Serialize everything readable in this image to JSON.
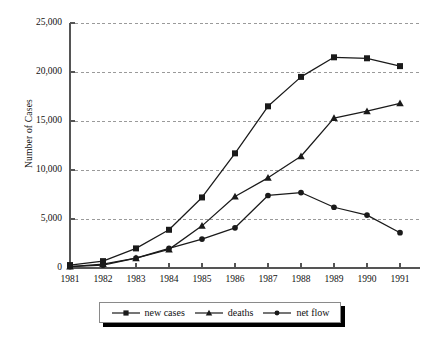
{
  "chart_data": {
    "type": "line",
    "title": "",
    "xlabel": "",
    "ylabel": "Number of Cases",
    "x": [
      1981,
      1982,
      1983,
      1984,
      1985,
      1986,
      1987,
      1988,
      1989,
      1990,
      1991
    ],
    "categories": [
      "1981",
      "1982",
      "1983",
      "1984",
      "1985",
      "1986",
      "1987",
      "1988",
      "1989",
      "1990",
      "1991"
    ],
    "ylim": [
      0,
      25000
    ],
    "ytick_labels": [
      "0",
      "5,000",
      "10,000",
      "15,000",
      "20,000",
      "25,000"
    ],
    "ytick_values": [
      0,
      5000,
      10000,
      15000,
      20000,
      25000
    ],
    "grid": true,
    "legend_position": "bottom",
    "series": [
      {
        "name": "new cases",
        "marker": "square",
        "values": [
          300,
          700,
          2000,
          3900,
          7200,
          11700,
          16500,
          19500,
          21500,
          21400,
          20600
        ]
      },
      {
        "name": "deaths",
        "marker": "triangle",
        "values": [
          150,
          400,
          1000,
          1900,
          4300,
          7300,
          9200,
          11400,
          15300,
          16000,
          16800
        ]
      },
      {
        "name": "net flow",
        "marker": "diamond",
        "values": [
          150,
          300,
          1000,
          2000,
          2950,
          4100,
          7400,
          7700,
          6200,
          5400,
          3600
        ]
      }
    ]
  },
  "legend": {
    "items": [
      {
        "label": "new cases"
      },
      {
        "label": "deaths"
      },
      {
        "label": "net flow"
      }
    ]
  },
  "colors": {
    "line": "#1a1a1a",
    "grid": "#9a9a9a",
    "axis": "#555555",
    "background": "#ffffff"
  }
}
